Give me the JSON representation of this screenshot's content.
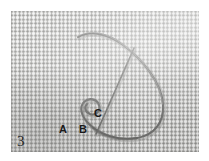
{
  "figure": {
    "number": "3",
    "caption_text": "",
    "background_color": "#ffffff",
    "fabric_color": "#d9d9d7",
    "thread_color": "#6e6e6c",
    "label_color": "#1a1a1a"
  },
  "photo": {
    "name": "suture-thread-on-woven-fabric",
    "left": 11,
    "top": 11,
    "width": 188,
    "height": 141
  },
  "markers": [
    {
      "label": "A",
      "x": 59,
      "y": 124,
      "description": "left hook end of thread"
    },
    {
      "label": "B",
      "x": 79,
      "y": 124,
      "description": "base of loop at lower bend"
    },
    {
      "label": "C",
      "x": 94,
      "y": 108,
      "description": "free straight end of thread"
    }
  ],
  "thread": {
    "name": "thread-strand",
    "stroke_color": "#6e6e6c",
    "stroke_width": 2.1,
    "loop_path": "M 67 26 C 79 19, 96 22, 112 34 C 132 49, 151 72, 152 94 C 153 112, 143 124, 126 127 C 108 130, 89 124, 78 113 C 70 105, 68 96, 73 91 C 78 86, 86 88, 88 94 C 90 100, 85 105, 79 103 C 74 101, 73 96, 76 93",
    "tail_path": "M 123 37 L 85 123"
  },
  "labels_group_name": "point-labels"
}
